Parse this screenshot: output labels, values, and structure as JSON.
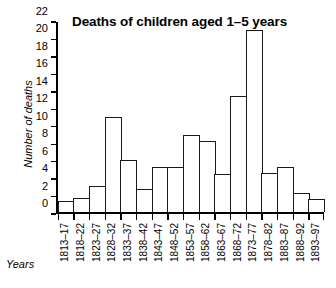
{
  "chart_data": {
    "type": "bar",
    "title": "Deaths of children aged 1–5 years",
    "xlabel": "Years",
    "ylabel": "Number of deaths",
    "ylim": [
      0,
      22
    ],
    "yticks": [
      0,
      2,
      4,
      6,
      8,
      10,
      12,
      14,
      16,
      18,
      20,
      22
    ],
    "grid": false,
    "legend": "none",
    "categories": [
      "1813–17",
      "1818–22",
      "1823–27",
      "1828–32",
      "1833–37",
      "1838–42",
      "1843–47",
      "1848–52",
      "1853–57",
      "1858–62",
      "1863–67",
      "1868–72",
      "1873–77",
      "1878–82",
      "1883–87",
      "1888–92",
      "1893–97"
    ],
    "values": [
      1.3,
      1.7,
      3.0,
      11.0,
      6.1,
      2.7,
      5.2,
      5.2,
      9.0,
      8.2,
      4.4,
      13.4,
      21.1,
      4.5,
      5.2,
      2.2,
      1.5
    ]
  },
  "colors": {
    "bar_outline": "#1a1a1a",
    "bar_fill": "#ffffff",
    "axis": "#000000",
    "background": "#ffffff"
  }
}
